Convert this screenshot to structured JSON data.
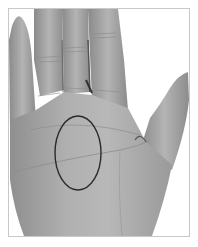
{
  "image": {
    "subject": "palm of hand",
    "style": "grayscale photograph",
    "annotation": {
      "shape": "ellipse",
      "region": "center of palm",
      "stroke_color": "#2a2a2a",
      "cx": 78,
      "cy": 153,
      "rx": 23,
      "ry": 37
    },
    "frame_color": "#c8c8c8",
    "background": "#ffffff",
    "skin_tone": "#a8a8a8"
  }
}
